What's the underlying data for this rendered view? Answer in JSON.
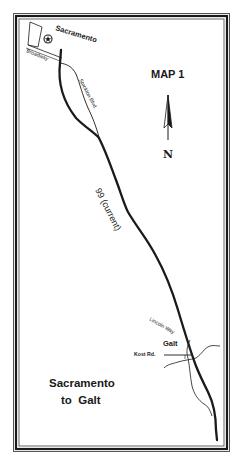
{
  "map": {
    "title": "MAP 1",
    "north_label": "N",
    "caption_line1": "Sacramento",
    "caption_line2": "to  Galt",
    "places": {
      "sacramento": "Sacramento",
      "galt": "Galt"
    },
    "roads": {
      "broadway": "Broadway",
      "stockton_blvd": "Stockton Blvd.",
      "highway": "99 (current)",
      "lincoln_way": "Lincoln Way",
      "kost_rd": "Kost Rd."
    },
    "icons": {
      "city_marker": "star-in-circle",
      "north_arrow": "north-arrow"
    },
    "colors": {
      "ink": "#1a1a1a",
      "paper": "#ffffff",
      "frame": "#222222"
    }
  }
}
